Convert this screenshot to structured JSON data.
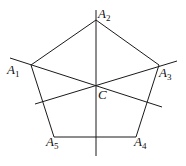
{
  "diagram": {
    "stroke_color": "#1a1a1a",
    "vertices": [
      {
        "name": "A",
        "sub": "1",
        "x": 31,
        "y": 65,
        "lx": 7,
        "ly": 74
      },
      {
        "name": "A",
        "sub": "2",
        "x": 96,
        "y": 20,
        "lx": 98,
        "ly": 18
      },
      {
        "name": "A",
        "sub": "3",
        "x": 159,
        "y": 65,
        "lx": 159,
        "ly": 77
      },
      {
        "name": "A",
        "sub": "4",
        "x": 136,
        "y": 137,
        "lx": 134,
        "ly": 146
      },
      {
        "name": "A",
        "sub": "5",
        "x": 54,
        "y": 137,
        "lx": 46,
        "ly": 146
      }
    ],
    "center": {
      "name": "C",
      "x": 96,
      "y": 85,
      "lx": 98,
      "ly": 99
    },
    "lines": [
      {
        "id": "axis-vertical",
        "x1": 96,
        "y1": 10,
        "x2": 96,
        "y2": 156
      },
      {
        "id": "axis-a1-c",
        "x1": 10,
        "y1": 58,
        "x2": 162,
        "y2": 107
      },
      {
        "id": "axis-a3-c",
        "x1": 35,
        "y1": 104,
        "x2": 177,
        "y2": 61
      }
    ]
  }
}
